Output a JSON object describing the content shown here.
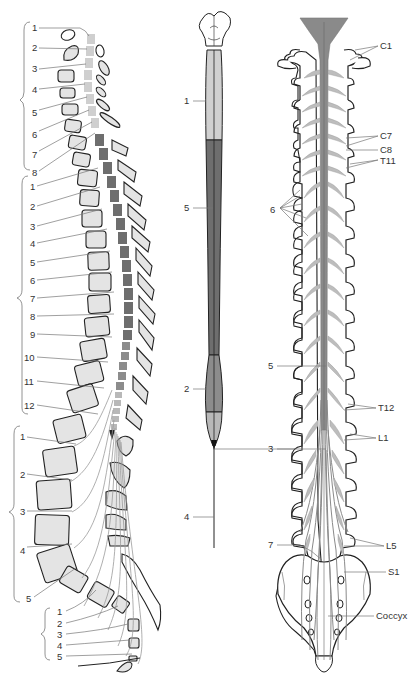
{
  "diagram": {
    "type": "anatomical-illustration",
    "colors": {
      "cervical_segment": "#cfcfcf",
      "thoracic_segment": "#6e6e6e",
      "lumbar_segment": "#8c8c8c",
      "sacral_segment": "#b8b8b8",
      "bone_fill": "#e4e4e4",
      "outline": "#222222",
      "label_line": "#777777"
    },
    "left_panel": {
      "title": "Lateral view of spinal segments and vertebrae",
      "groups": [
        {
          "name": "cervical",
          "labels": [
            "1",
            "2",
            "3",
            "4",
            "5",
            "6",
            "7",
            "8"
          ]
        },
        {
          "name": "thoracic",
          "labels": [
            "1",
            "2",
            "3",
            "4",
            "5",
            "6",
            "7",
            "8",
            "9",
            "10",
            "11",
            "12"
          ]
        },
        {
          "name": "lumbar",
          "labels": [
            "1",
            "2",
            "3",
            "4",
            "5"
          ]
        },
        {
          "name": "sacral",
          "labels": [
            "1",
            "2",
            "3",
            "4",
            "5"
          ]
        }
      ]
    },
    "middle_panel": {
      "title": "Spinal cord, posterior view",
      "labels": [
        "1",
        "5",
        "2",
        "4"
      ]
    },
    "right_panel": {
      "title": "Spinal cord within vertebral canal, posterior view",
      "right_labels": [
        "C1",
        "C7",
        "C8",
        "T11",
        "T12",
        "L1",
        "L5",
        "S1",
        "Coccyx"
      ],
      "left_labels": [
        "6",
        "5",
        "3",
        "7"
      ]
    }
  }
}
